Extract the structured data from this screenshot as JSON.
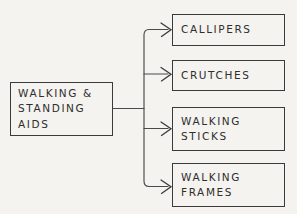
{
  "diagram": {
    "type": "hand-drawn-tree-flowchart",
    "orientation": "left-to-right",
    "canvas": {
      "width": 297,
      "height": 214
    },
    "colors": {
      "background": "#f5f3ef",
      "stroke": "#3a3a3a",
      "connector": "#4a4a4a",
      "text": "#2e2e2e"
    },
    "root": {
      "id": "walking-standing-aids",
      "lines": [
        "WALKING &",
        "STANDING",
        "AIDS"
      ]
    },
    "children": [
      {
        "id": "callipers",
        "lines": [
          "CALLIPERS"
        ]
      },
      {
        "id": "crutches",
        "lines": [
          "CRUTCHES"
        ]
      },
      {
        "id": "walking-sticks",
        "lines": [
          "WALKING",
          "STICKS"
        ]
      },
      {
        "id": "walking-frames",
        "lines": [
          "WALKING",
          "FRAMES"
        ]
      }
    ]
  }
}
